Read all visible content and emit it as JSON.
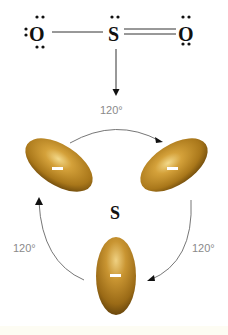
{
  "diagram": {
    "type": "molecular-geometry",
    "lewis_structure": {
      "left_atom": "O",
      "central_atom": "S",
      "right_atom": "O",
      "left_bond": "single",
      "right_bond": "double",
      "left_atom_lone_pairs": 3,
      "central_atom_lone_pairs": 1,
      "right_atom_lone_pairs": 2
    },
    "electron_domain_model": {
      "center_label": "S",
      "domains": [
        {
          "position": "upper-left",
          "charge": "−"
        },
        {
          "position": "upper-right",
          "charge": "−"
        },
        {
          "position": "bottom",
          "charge": "−"
        }
      ],
      "angles": [
        {
          "position": "top",
          "label": "120°"
        },
        {
          "position": "right",
          "label": "120°"
        },
        {
          "position": "left",
          "label": "120°"
        }
      ]
    },
    "colors": {
      "domain_fill": "#b8861c",
      "domain_highlight": "#f0d27a",
      "domain_shadow": "#7a5410",
      "arrow": "#555555",
      "text": "#111111",
      "angle_text": "#8a8a8a"
    }
  }
}
